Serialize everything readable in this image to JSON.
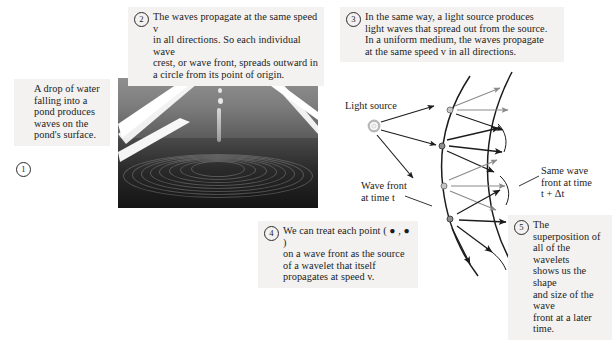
{
  "figure": {
    "background": "#ffffff",
    "callout_bg": "#f3f2f0",
    "ink": "#1c1c1c",
    "accent_gray": "#8a8a8a"
  },
  "callouts": [
    {
      "number": "1",
      "text": "A drop of water\nfalling into a\npond produces\nwaves on the\npond's surface."
    },
    {
      "number": "2",
      "text": "The waves propagate at the same speed v\nin all directions. So each individual wave\ncrest, or wave front, spreads outward in\na circle from its point of origin."
    },
    {
      "number": "3",
      "text": "In the same way, a light source produces\nlight waves that spread out from the source.\nIn a uniform medium, the waves propagate\nat the same speed v in all directions."
    },
    {
      "number": "4",
      "text": "We can treat each point ( ● , ● )\non a wave front as the source\nof a wavelet that itself\npropagates at speed v."
    },
    {
      "number": "5",
      "text": "The superposition of\nall of the wavelets\nshows us the shape\nand size of the wave\nfront at a later time."
    }
  ],
  "photo": {
    "caption": "Photograph of a water drop striking a pond surface producing concentric circular ripples",
    "alt_name": "water-drop-ripples-photograph"
  },
  "diagram": {
    "light_source_label": "Light source",
    "wave_front_t_label": "Wave front\nat time t",
    "same_wave_front_label": "Same wave\nfront at time\nt + Δt",
    "source_point_color": "#c9c9c9",
    "wavelet_point_color": "#9b9b9b",
    "inner_arc_name": "wave-front-at-time-t",
    "outer_arc_name": "wave-front-at-time-t-plus-delta-t",
    "ray_count": 3,
    "wavelet_source_count": 4
  }
}
